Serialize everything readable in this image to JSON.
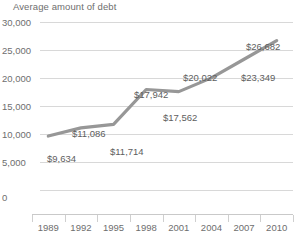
{
  "chart_data": {
    "type": "line",
    "title": "Average amount of debt",
    "xlabel": "",
    "ylabel": "",
    "grid": true,
    "legend": "none",
    "ylim": [
      0,
      30000
    ],
    "ytick_labels": [
      "30,000",
      "25,000",
      "20,000",
      "15,000",
      "10,000",
      "5,000",
      "0"
    ],
    "ytick_values": [
      30000,
      25000,
      20000,
      15000,
      10000,
      5000,
      0
    ],
    "categories": [
      "1989",
      "1992",
      "1995",
      "1998",
      "2001",
      "2004",
      "2007",
      "2010"
    ],
    "x": [
      1989,
      1992,
      1995,
      1998,
      2001,
      2004,
      2007,
      2010
    ],
    "values": [
      9634,
      11086,
      11714,
      17942,
      17562,
      20022,
      23349,
      26682
    ],
    "point_labels": [
      "$9,634",
      "$11,086",
      "$11,714",
      "$17,942",
      "$17,562",
      "$20,022",
      "$23,349",
      "$26,682"
    ],
    "series": [
      {
        "name": "Average amount of debt",
        "color": "#979797",
        "values": [
          9634,
          11086,
          11714,
          17942,
          17562,
          20022,
          23349,
          26682
        ]
      }
    ],
    "colors": {
      "line": "#979797",
      "grid": "#d8d8d8",
      "axis": "#c9c9c9",
      "text": "#6e6e6e",
      "background": "#ffffff"
    }
  }
}
